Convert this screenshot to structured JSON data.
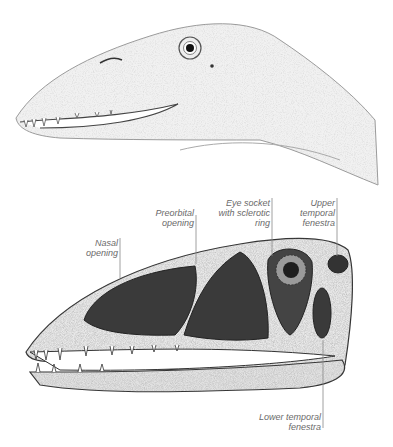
{
  "figure": {
    "top_illustration": "reptile-head-fleshed",
    "bottom_illustration": "reptile-skull-labeled"
  },
  "labels": {
    "nasal": "Nasal\nopening",
    "preorbital": "Preorbital\nopening",
    "eye_socket": "Eye socket\nwith sclerotic\nring",
    "upper_temporal": "Upper\ntemporal\nfenestra",
    "lower_temporal": "Lower temporal\nfenestra"
  },
  "colors": {
    "ink": "#2b2b2b",
    "shade": "#d9d9d9",
    "opening": "#3a3a3a",
    "label": "#6a6a6a"
  }
}
